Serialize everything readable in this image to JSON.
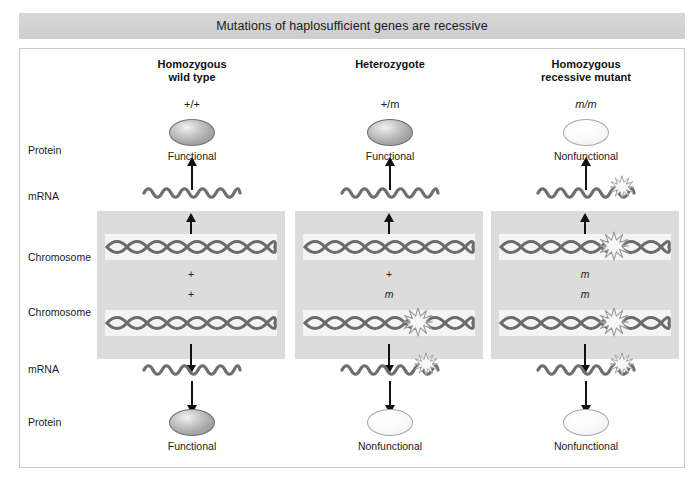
{
  "figure": {
    "title": "Mutations of haplosufficient genes are recessive",
    "row_labels": {
      "protein_top": "Protein",
      "mrna_top": "mRNA",
      "chromosome_top": "Chromosome",
      "chromosome_bottom": "Chromosome",
      "mrna_bottom": "mRNA",
      "protein_bottom": "Protein"
    },
    "columns": [
      {
        "id": "homozygous-wild-type",
        "name_line1": "Homozygous",
        "name_line2": "wild type",
        "genotype": "+/+",
        "protein_top": {
          "caption": "Functional",
          "state": "functional"
        },
        "protein_bottom": {
          "caption": "Functional",
          "state": "functional"
        },
        "mrna_top_mutated": false,
        "mrna_bottom_mutated": false,
        "allele_top": "+",
        "allele_bottom": "+",
        "allele_top_mutated": false,
        "allele_bottom_mutated": false
      },
      {
        "id": "heterozygote",
        "name_line1": "Heterozygote",
        "name_line2": "",
        "genotype": "+/m",
        "protein_top": {
          "caption": "Functional",
          "state": "functional"
        },
        "protein_bottom": {
          "caption": "Nonfunctional",
          "state": "nonfunctional"
        },
        "mrna_top_mutated": false,
        "mrna_bottom_mutated": true,
        "allele_top": "+",
        "allele_bottom": "m",
        "allele_top_mutated": false,
        "allele_bottom_mutated": true
      },
      {
        "id": "homozygous-recessive-mutant",
        "name_line1": "Homozygous",
        "name_line2": "recessive mutant",
        "genotype": "m/m",
        "protein_top": {
          "caption": "Nonfunctional",
          "state": "nonfunctional"
        },
        "protein_bottom": {
          "caption": "Nonfunctional",
          "state": "nonfunctional"
        },
        "mrna_top_mutated": true,
        "mrna_bottom_mutated": true,
        "allele_top": "m",
        "allele_bottom": "m",
        "allele_top_mutated": true,
        "allele_bottom_mutated": true
      }
    ],
    "icons": {
      "mutation": "mutation-starburst-icon",
      "dna": "dna-double-helix-icon",
      "mrna": "mrna-wave-icon",
      "transcription_arrow": "transcription-arrow-icon"
    },
    "colors": {
      "title_bar": "#d2d2d2",
      "cell_panel": "#dcdcdc",
      "dna_band": "#f4f4f4",
      "dna_strand": "#6b6b6b",
      "mrna_strand": "#6e6e6e",
      "arrow": "#111111",
      "frame_border": "#c9c9c9",
      "protein_functional": "#a8a8a8",
      "protein_nonfunctional": "#f7f7f7"
    }
  }
}
